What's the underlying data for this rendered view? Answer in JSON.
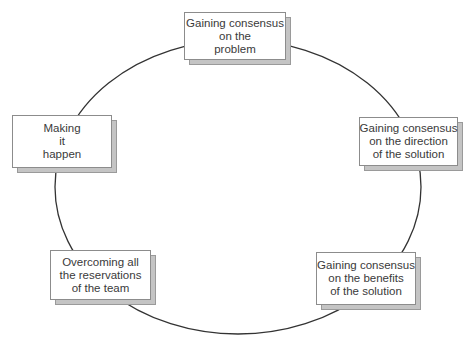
{
  "diagram": {
    "type": "cycle",
    "colors": {
      "cycle_line": "#333333",
      "box_fill": "#ffffff",
      "box_border": "#8c8c8c",
      "shadow_fill": "#c4c4c4",
      "text": "#3a3a3a"
    },
    "nodes": [
      {
        "id": "problem-consensus",
        "lines": [
          "Gaining consensus",
          "on the",
          "problem"
        ]
      },
      {
        "id": "direction-consensus",
        "lines": [
          "Gaining consensus",
          "on the direction",
          "of the solution"
        ]
      },
      {
        "id": "benefits-consensus",
        "lines": [
          "Gaining consensus",
          "on the benefits",
          "of the solution"
        ]
      },
      {
        "id": "overcoming-reservations",
        "lines": [
          "Overcoming all",
          "the reservations",
          "of the team"
        ]
      },
      {
        "id": "making-it-happen",
        "lines": [
          "Making",
          "it",
          "happen"
        ]
      }
    ]
  }
}
